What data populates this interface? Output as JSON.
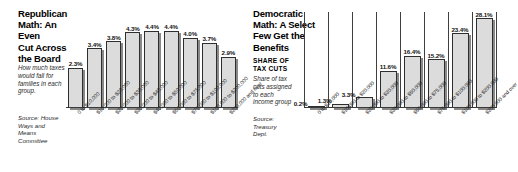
{
  "left": {
    "headline": "Republican\nMath: An Even\nCut Across\nthe Board",
    "blurb": "How much taxes\nwould fall for\nfamilies in each\ngroup.",
    "source": "Source: House\nWays and\nMeans\nCommittee"
  },
  "right": {
    "headline": "Democratic\nMath: A Select\nFew Get the\nBenefits",
    "kicker": "SHARE OF\nTAX CUTS",
    "blurb": "Share of tax\ncuts assigned\nto each\nincome group",
    "source": "Source:\nTreasury\nDept."
  },
  "chart_data": [
    {
      "type": "bar",
      "title": "Republican Math: An Even Cut Across the Board",
      "subtitle": "How much taxes would fall for families in each group.",
      "source": "Source: House Ways and Means Committee",
      "xlabel": "",
      "ylabel": "",
      "ylim": [
        0,
        5.0
      ],
      "grid": false,
      "legend": "none",
      "categories": [
        "0 to $10,000",
        "$10,000 to $20,000",
        "$20,000 to $30,000",
        "$30,000 to $40,000",
        "$40,000 to $50,000",
        "$50,000 to $75,000",
        "$75,000 to $100,000",
        "$100,000 to $200,000",
        "$200,000 and over"
      ],
      "values": [
        2.3,
        3.4,
        3.8,
        4.3,
        4.4,
        4.4,
        4.0,
        3.7,
        2.9
      ],
      "value_labels": [
        "2.3%",
        "3.4%",
        "3.8%",
        "4.3%",
        "4.4%",
        "4.4%",
        "4.0%",
        "3.7%",
        "2.9%"
      ]
    },
    {
      "type": "bar",
      "title": "Democratic Math: A Select Few Get the Benefits",
      "subtitle": "SHARE OF TAX CUTS — Share of tax cuts assigned to each income group",
      "source": "Source: Treasury Dept.",
      "xlabel": "",
      "ylabel": "",
      "ylim": [
        0,
        30.0
      ],
      "grid": false,
      "legend": "none",
      "categories": [
        "0 to $10,000",
        "$10,000 to $20,000",
        "$20,000 to $30,000",
        "$30,000 to $50,000",
        "$50,000 to $75,000",
        "$75,000 to $100,000",
        "$100,000 to $200,000",
        "$200,000 and over"
      ],
      "values": [
        0.2,
        1.3,
        3.3,
        11.6,
        16.4,
        15.2,
        23.4,
        28.1
      ],
      "value_labels": [
        "0.2%",
        "1.3%",
        "3.3%",
        "11.6%",
        "16.4%",
        "15.2%",
        "23.4%",
        "28.1%"
      ]
    }
  ]
}
